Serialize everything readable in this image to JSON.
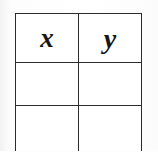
{
  "document": {
    "kind": "printed-table-scan",
    "background_color": "#fdfdfd",
    "ink_color": "#2b2b2b",
    "text_color": "#161616"
  },
  "table": {
    "name": "xy-value-table",
    "columns": [
      {
        "key": "x",
        "header": "x"
      },
      {
        "key": "y",
        "header": "y"
      }
    ],
    "rows": [
      {
        "type": "data",
        "cells": [
          "",
          ""
        ]
      },
      {
        "type": "clipped",
        "cells": [
          "",
          ""
        ]
      }
    ],
    "geometry": {
      "left": 15,
      "top": 13,
      "width": 126,
      "column_width": 63,
      "header_row_height": 48,
      "data_row_height": 42,
      "clipped_row_height": 46,
      "border_width": 1.6,
      "bottom_clipped": true
    }
  }
}
